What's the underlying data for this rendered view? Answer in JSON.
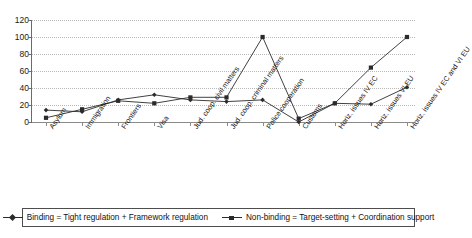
{
  "chart_data": {
    "type": "line",
    "title": "",
    "xlabel": "",
    "ylabel": "",
    "ylim": [
      0,
      120
    ],
    "ytick_step": 20,
    "yticks": [
      0,
      20,
      40,
      60,
      80,
      100,
      120
    ],
    "grid": true,
    "legend_position": "bottom",
    "categories": [
      "Asylum",
      "Immigration",
      "Frontiers",
      "Visa",
      "Jud. coop. civil matters",
      "Jud. coop. criminal matters",
      "Police cooperation",
      "Customs",
      "Horiz. issues IV EC",
      "Horiz. issues VI EU",
      "Horiz. issues IV EC and VI EU"
    ],
    "series": [
      {
        "name": "Binding = Tight regulation + Framework regulation",
        "marker": "diamond",
        "color": "#2b2b2b",
        "values": [
          14,
          12,
          26,
          32,
          26,
          24,
          26,
          0,
          22,
          21,
          41
        ]
      },
      {
        "name": "Non-binding = Target-setting + Coordination support",
        "marker": "square",
        "color": "#2b2b2b",
        "values": [
          5,
          15,
          25,
          22,
          29,
          29,
          100,
          4,
          22,
          64,
          100
        ]
      }
    ]
  },
  "axis": {
    "y_tick_labels": [
      "0",
      "20",
      "40",
      "60",
      "80",
      "100",
      "120"
    ]
  },
  "legend": {
    "items": [
      {
        "label": "Binding = Tight regulation + Framework regulation",
        "marker": "diamond"
      },
      {
        "label": "Non-binding = Target-setting + Coordination support",
        "marker": "square"
      }
    ]
  }
}
